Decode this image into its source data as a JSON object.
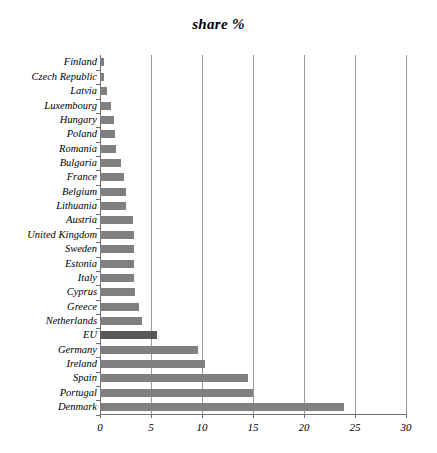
{
  "chart_data": {
    "type": "bar",
    "orientation": "horizontal",
    "title": "share %",
    "xlabel": "",
    "ylabel": "",
    "xlim": [
      0,
      30
    ],
    "xticks": [
      0,
      5,
      10,
      15,
      20,
      25,
      30
    ],
    "xtick_labels": [
      "0",
      "5",
      "10",
      "15",
      "20",
      "25",
      "30"
    ],
    "grid": true,
    "grid_axis": "x",
    "legend": false,
    "categories": [
      "Finland",
      "Czech Republic",
      "Latvia",
      "Luxembourg",
      "Hungary",
      "Poland",
      "Romania",
      "Bulgaria",
      "France",
      "Belgium",
      "Lithuania",
      "Austria",
      "United Kingdom",
      "Sweden",
      "Estonia",
      "Italy",
      "Cyprus",
      "Greece",
      "Netherlands",
      "EU",
      "Germany",
      "Ireland",
      "Spain",
      "Portugal",
      "Denmark"
    ],
    "values": [
      0.4,
      0.4,
      0.7,
      1.1,
      1.4,
      1.5,
      1.6,
      2.1,
      2.4,
      2.5,
      2.5,
      3.2,
      3.3,
      3.3,
      3.3,
      3.3,
      3.4,
      3.8,
      4.1,
      5.6,
      9.6,
      10.3,
      14.5,
      15.0,
      23.9
    ],
    "highlight_category": "EU",
    "colors": {
      "bar": "#808080",
      "bar_highlight": "#595959",
      "gridline": "#9a9a9a",
      "axis": "#6e6e6e",
      "text": "#000000",
      "background": "#ffffff"
    }
  }
}
